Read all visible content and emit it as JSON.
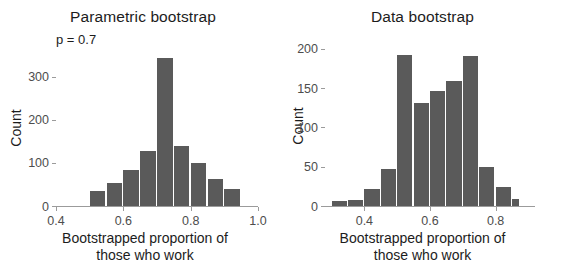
{
  "figure": {
    "background": "#ffffff",
    "bar_color": "#5a5a5a",
    "axis_color": "#9b9b9b",
    "text_color": "#1c1c1c"
  },
  "panels": [
    {
      "key": "parametric",
      "title": "Parametric bootstrap",
      "subtitle": "p = 0.7",
      "ylabel": "Count",
      "xlabel_line1": "Bootstrapped proportion of",
      "xlabel_line2": "those who work"
    },
    {
      "key": "data",
      "title": "Data bootstrap",
      "subtitle": "",
      "ylabel": "Count",
      "xlabel_line1": "Bootstrapped proportion of",
      "xlabel_line2": "those who work"
    }
  ],
  "chart_data": [
    {
      "type": "bar",
      "id": "parametric-bootstrap-histogram",
      "title": "Parametric bootstrap",
      "subtitle": "p = 0.7",
      "xlabel": "Bootstrapped proportion of those who work",
      "ylabel": "Count",
      "grid": false,
      "legend": false,
      "xlim": [
        0.4,
        1.0
      ],
      "ylim": [
        0,
        360
      ],
      "xticks": [
        0.4,
        0.6,
        0.8,
        1.0
      ],
      "xtick_labels": [
        "0.4",
        "0.6",
        "0.8",
        "1.0"
      ],
      "yticks": [
        0,
        100,
        200,
        300
      ],
      "ytick_labels": [
        "0",
        "100",
        "200",
        "300"
      ],
      "bin_width": 0.05,
      "bin_edges": [
        0.45,
        0.5,
        0.55,
        0.6,
        0.65,
        0.7,
        0.75,
        0.8,
        0.85,
        0.9,
        0.95
      ],
      "bin_centers": [
        0.475,
        0.525,
        0.575,
        0.625,
        0.675,
        0.725,
        0.775,
        0.825,
        0.875,
        0.925
      ],
      "values": [
        3,
        38,
        55,
        85,
        130,
        345,
        142,
        103,
        65,
        42
      ]
    },
    {
      "type": "bar",
      "id": "data-bootstrap-histogram",
      "title": "Data bootstrap",
      "subtitle": "",
      "xlabel": "Bootstrapped proportion of those who work",
      "ylabel": "Count",
      "grid": false,
      "legend": false,
      "xlim": [
        0.28,
        0.92
      ],
      "ylim": [
        0,
        205
      ],
      "xticks": [
        0.4,
        0.6,
        0.8
      ],
      "xtick_labels": [
        "0.4",
        "0.6",
        "0.8"
      ],
      "yticks": [
        0,
        50,
        100,
        150,
        200
      ],
      "ytick_labels": [
        "0",
        "50",
        "100",
        "150",
        "200"
      ],
      "bin_width": 0.05,
      "bin_edges": [
        0.3,
        0.35,
        0.4,
        0.45,
        0.5,
        0.55,
        0.6,
        0.65,
        0.7,
        0.75,
        0.8,
        0.85,
        0.875
      ],
      "bin_centers": [
        0.325,
        0.375,
        0.425,
        0.475,
        0.525,
        0.575,
        0.625,
        0.675,
        0.725,
        0.775,
        0.825,
        0.8625
      ],
      "values": [
        8,
        9,
        23,
        49,
        194,
        132,
        148,
        160,
        192,
        51,
        25,
        10
      ]
    }
  ]
}
